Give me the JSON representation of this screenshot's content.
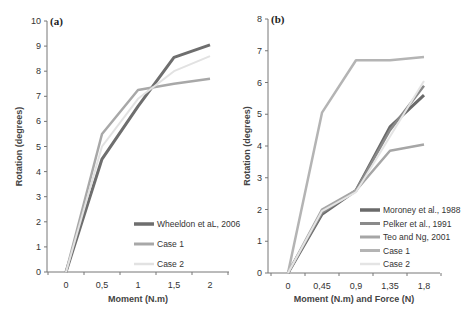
{
  "chart_data": [
    {
      "type": "line",
      "panel": "(a)",
      "title": "",
      "xlabel": "Moment (N.m)",
      "ylabel": "Rotation (degrees)",
      "x": [
        0,
        0.5,
        1,
        1.5,
        2
      ],
      "x_tick_labels": [
        "0",
        "0,5",
        "1",
        "1,5",
        "2"
      ],
      "y_tick_labels": [
        "0",
        "1",
        "2",
        "3",
        "4",
        "5",
        "6",
        "7",
        "8",
        "9",
        "10"
      ],
      "ylim": [
        0,
        10
      ],
      "grid": false,
      "legend_position": "lower right",
      "series": [
        {
          "name": "Wheeldon et aL, 2006",
          "color": "#6e6e6e",
          "width": 3,
          "values": [
            0,
            4.5,
            6.6,
            8.55,
            9.05
          ]
        },
        {
          "name": "Case 1",
          "color": "#a8a8a8",
          "width": 2.5,
          "values": [
            0,
            5.5,
            7.25,
            7.5,
            7.7
          ]
        },
        {
          "name": "Case 2",
          "color": "#e2e2e2",
          "width": 2,
          "values": [
            0,
            5.0,
            6.9,
            8.0,
            8.6
          ]
        }
      ]
    },
    {
      "type": "line",
      "panel": "(b)",
      "title": "",
      "xlabel": "Moment (N.m) and Force (N)",
      "ylabel": "Rotation (degrees)",
      "x": [
        0,
        0.45,
        0.9,
        1.35,
        1.8
      ],
      "x_tick_labels": [
        "0",
        "0,45",
        "0,9",
        "1,35",
        "1,8"
      ],
      "y_tick_labels": [
        "0",
        "1",
        "2",
        "3",
        "4",
        "5",
        "6",
        "7",
        "8"
      ],
      "ylim": [
        0,
        8
      ],
      "grid": false,
      "legend_position": "lower right",
      "series": [
        {
          "name": "Moroney et al., 1988",
          "color": "#6a6a6a",
          "width": 3,
          "values": [
            0,
            1.85,
            2.6,
            4.6,
            5.6
          ]
        },
        {
          "name": "Pelker et al., 1991",
          "color": "#8a8a8a",
          "width": 2.5,
          "values": [
            0,
            1.9,
            2.6,
            4.5,
            5.9
          ]
        },
        {
          "name": "Teo and Ng, 2001",
          "color": "#a6a6a6",
          "width": 2.5,
          "values": [
            0,
            2.0,
            2.6,
            3.85,
            4.05
          ]
        },
        {
          "name": "Case 1",
          "color": "#b4b4b4",
          "width": 2.5,
          "values": [
            0,
            5.05,
            6.7,
            6.7,
            6.8
          ]
        },
        {
          "name": "Case 2",
          "color": "#e4e4e4",
          "width": 2,
          "values": [
            0,
            1.95,
            2.55,
            4.3,
            6.05
          ]
        }
      ]
    }
  ]
}
